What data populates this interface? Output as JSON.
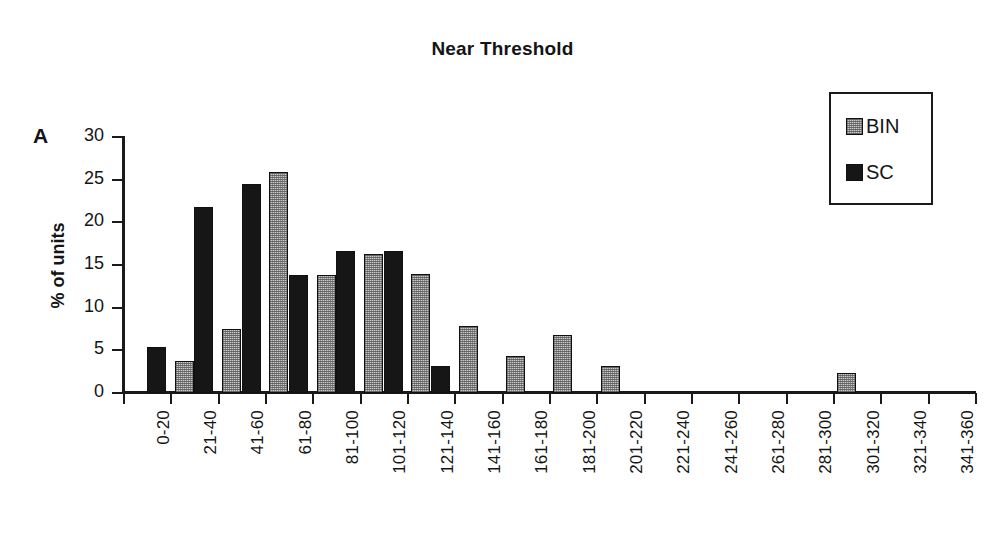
{
  "figure": {
    "panel_label": "A",
    "title": "Near Threshold"
  },
  "legend": {
    "position": "top-right",
    "entries": [
      {
        "label": "BIN",
        "swatch": "gray-hatched-square",
        "color": "#c9c9c9"
      },
      {
        "label": "SC",
        "swatch": "black-filled-square",
        "color": "#161616"
      }
    ]
  },
  "axes": {
    "y_label": "% of units",
    "y_ticks": [
      "0",
      "5",
      "10",
      "15",
      "20",
      "25",
      "30"
    ],
    "x_label": ""
  },
  "chart_data": {
    "type": "bar",
    "title": "Near Threshold",
    "xlabel": "",
    "ylabel": "% of units",
    "ylim": [
      0,
      30
    ],
    "ytick_step": 5,
    "grid": false,
    "legend_position": "top-right",
    "categories": [
      "0-20",
      "21-40",
      "41-60",
      "61-80",
      "81-100",
      "101-120",
      "121-140",
      "141-160",
      "161-180",
      "181-200",
      "201-220",
      "221-240",
      "241-260",
      "261-280",
      "281-300",
      "301-320",
      "321-340",
      "341-360"
    ],
    "series": [
      {
        "name": "BIN",
        "color": "#c9c9c9",
        "values": [
          0,
          3.8,
          7.5,
          25.9,
          13.8,
          16.3,
          13.9,
          7.9,
          4.3,
          6.8,
          3.2,
          0,
          0,
          0,
          0,
          2.3,
          0,
          0
        ]
      },
      {
        "name": "SC",
        "color": "#161616",
        "values": [
          5.4,
          21.8,
          24.5,
          13.8,
          16.6,
          16.7,
          3.2,
          0,
          0,
          0,
          0,
          0,
          0,
          0,
          0,
          0,
          0,
          0
        ]
      }
    ]
  }
}
